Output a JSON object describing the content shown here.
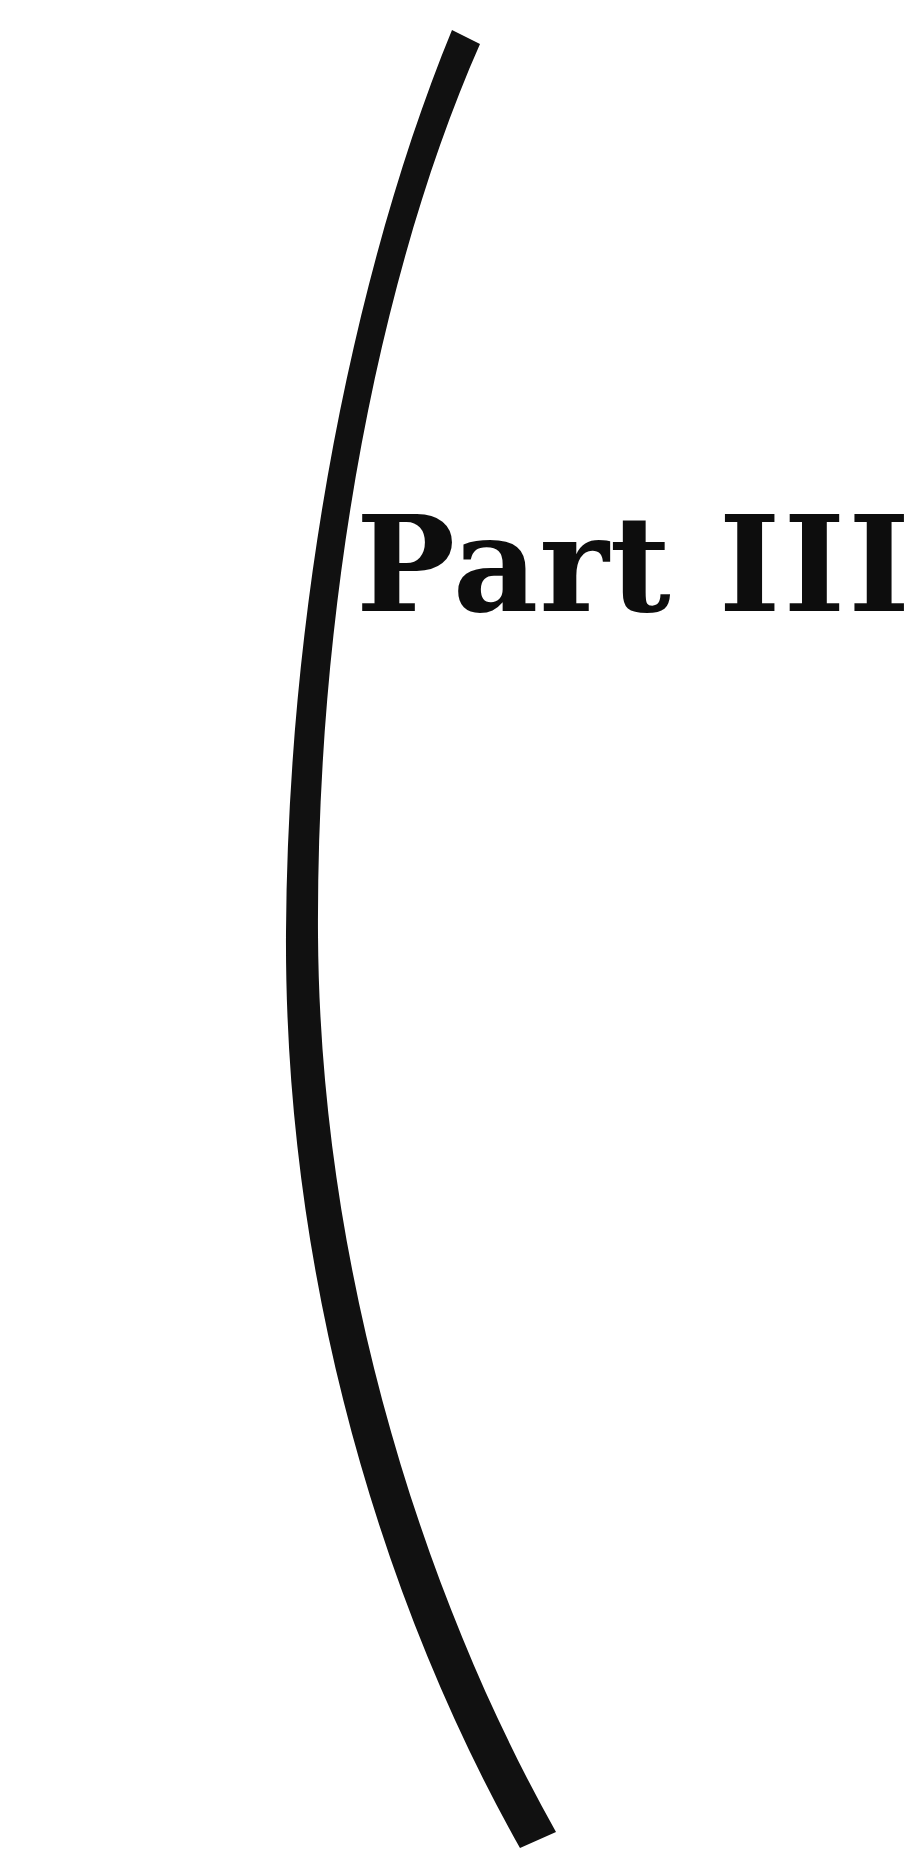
{
  "page": {
    "kind": "book-part-divider",
    "width": 912,
    "height": 1863,
    "background_color": "#ffffff",
    "ink_color": "#111111"
  },
  "title": {
    "full_text": "Part III",
    "word": "Part",
    "numeral": "III",
    "space": " "
  },
  "decoration": {
    "name": "curved-arc-rule",
    "description": "large black crescent arc sweeping from upper right down to lower right with leftward belly",
    "color": "#111111",
    "top_point": {
      "x": 480,
      "y": 44
    },
    "belly_point": {
      "x": 318,
      "y": 930
    },
    "bottom_point": {
      "x": 556,
      "y": 1832
    },
    "stroke_width": 30
  },
  "chart_data": {
    "type": "line",
    "title": "Part III",
    "x": [
      480,
      404,
      347,
      320,
      318,
      341,
      390,
      462,
      556
    ],
    "y": [
      44,
      280,
      530,
      760,
      930,
      1160,
      1400,
      1620,
      1832
    ],
    "xlabel": "",
    "ylabel": "",
    "xlim": [
      0,
      912
    ],
    "ylim": [
      0,
      1863
    ],
    "grid": false,
    "legend": "none"
  }
}
